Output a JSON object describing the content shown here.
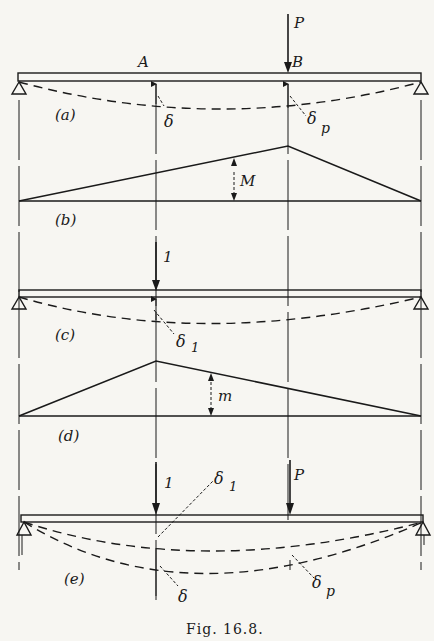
{
  "figure": {
    "caption": "Fig. 16.8.",
    "points": {
      "A": "A",
      "B": "B"
    },
    "loads": {
      "P_top": "P",
      "unit_c": "1",
      "unit_e": "1",
      "P_e": "P"
    },
    "panels": {
      "a": {
        "label": "(a)",
        "delta": "δ",
        "delta_p": "δ",
        "delta_p_sub": "p"
      },
      "b": {
        "label": "(b)",
        "moment": "M"
      },
      "c": {
        "label": "(c)",
        "delta1": "δ",
        "delta1_sub": "1"
      },
      "d": {
        "label": "(d)",
        "moment": "m"
      },
      "e": {
        "label": "(e)",
        "delta1": "δ",
        "delta1_sub": "1",
        "delta": "δ",
        "delta_p": "δ",
        "delta_p_sub": "p"
      }
    }
  },
  "colors": {
    "ink": "#1a1a1a",
    "paper": "#f7f6f2"
  }
}
